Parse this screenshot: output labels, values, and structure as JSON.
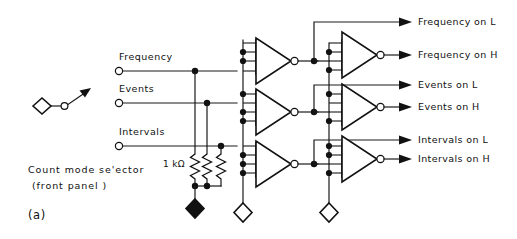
{
  "figure": {
    "label": "(a)",
    "caption_line1": "Count mode se'ector",
    "caption_line2": "(front panel )"
  },
  "switch": {
    "name": "count-mode-selector-switch",
    "pole_symbol": "diamond",
    "throw_symbol": "open-circle"
  },
  "inputs": [
    {
      "label": "Frequency",
      "terminal": "open-circle"
    },
    {
      "label": "Events",
      "terminal": "open-circle"
    },
    {
      "label": "Intervals",
      "terminal": "open-circle"
    }
  ],
  "resistors": [
    {
      "value": "1 kΩ",
      "show_label": true
    },
    {
      "value": "1 kΩ",
      "show_label": false
    },
    {
      "value": "1 kΩ",
      "show_label": false
    }
  ],
  "resistor_label": "1 kΩ",
  "outputs": [
    {
      "label": "Frequency  on L",
      "terminal": "arrow"
    },
    {
      "label": "Frequency  on H",
      "terminal": "arrow",
      "bubble": true
    },
    {
      "label": "Events  on L",
      "terminal": "arrow"
    },
    {
      "label": "Events  on H",
      "terminal": "arrow",
      "bubble": true
    },
    {
      "label": "Intervals  on L",
      "terminal": "arrow"
    },
    {
      "label": "Intervals  on H",
      "terminal": "arrow",
      "bubble": true
    }
  ],
  "gates": {
    "stage1": [
      {
        "name": "inverter-frequency-stage1",
        "inputs": 4,
        "bubble": true
      },
      {
        "name": "inverter-events-stage1",
        "inputs": 4,
        "bubble": true
      },
      {
        "name": "inverter-intervals-stage1",
        "inputs": 4,
        "bubble": true
      }
    ],
    "stage2": [
      {
        "name": "inverter-frequency-stage2",
        "inputs": 4,
        "bubble": true
      },
      {
        "name": "inverter-events-stage2",
        "inputs": 4,
        "bubble": true
      },
      {
        "name": "inverter-intervals-stage2",
        "inputs": 4,
        "bubble": true
      }
    ]
  },
  "grounds": [
    {
      "name": "ground-resistor-bus",
      "style": "filled-diamond"
    },
    {
      "name": "ground-stage1-bus",
      "style": "open-diamond"
    },
    {
      "name": "ground-stage2-bus",
      "style": "open-diamond"
    }
  ],
  "colors": {
    "ink": "#111111",
    "background": "#ffffff"
  }
}
